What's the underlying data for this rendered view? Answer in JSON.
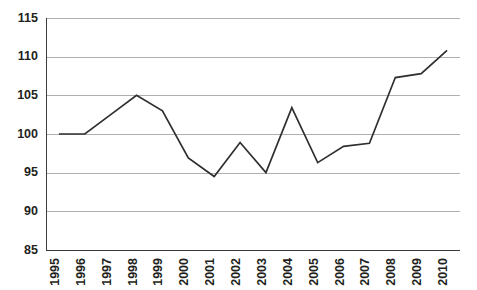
{
  "chart_data": {
    "type": "line",
    "title": "",
    "subtitle": "",
    "xlabel": "",
    "ylabel": "",
    "categories": [
      "1995",
      "1996",
      "1997",
      "1998",
      "1999",
      "2000",
      "2001",
      "2002",
      "2003",
      "2004",
      "2005",
      "2006",
      "2007",
      "2008",
      "2009",
      "2010"
    ],
    "values": [
      100,
      100,
      102.5,
      105,
      103,
      96.9,
      94.5,
      98.9,
      95,
      103.4,
      96.3,
      98.4,
      98.8,
      107.3,
      107.8,
      110.8
    ],
    "series": [
      {
        "name": "index",
        "values": [
          100,
          100,
          102.5,
          105,
          103,
          96.9,
          94.5,
          98.9,
          95,
          103.4,
          96.3,
          98.4,
          98.8,
          107.3,
          107.8,
          110.8
        ]
      }
    ],
    "ylim": [
      85,
      115
    ],
    "yticks": [
      85,
      90,
      95,
      100,
      105,
      110,
      115
    ],
    "ytick_labels": [
      "85",
      "90",
      "95",
      "100",
      "105",
      "110",
      "115"
    ],
    "xtick_labels": [
      "1995",
      "1996",
      "1997",
      "1998",
      "1999",
      "2000",
      "2001",
      "2002",
      "2003",
      "2004",
      "2005",
      "2006",
      "2007",
      "2008",
      "2009",
      "2010"
    ],
    "xtick_rotation": -90,
    "grid": true,
    "grid_axis": "y",
    "legend": false,
    "legend_position": "none",
    "annotations": [],
    "colors": {
      "line": "#302f2f",
      "gridline": "#a6a6a6",
      "axis": "#3b3b3b",
      "background": "#ffffff",
      "text": "#231f20"
    }
  },
  "layout": {
    "plot_left": 46,
    "plot_right": 460,
    "plot_top": 18,
    "plot_bottom": 250,
    "point_spacing": 25.8
  }
}
